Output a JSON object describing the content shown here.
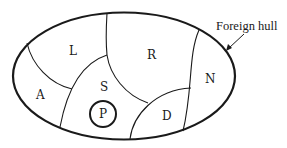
{
  "diagram": {
    "type": "region map inside elliptical hull",
    "hull_label": "Foreign hull",
    "regions": [
      {
        "id": "L",
        "label": "L"
      },
      {
        "id": "R",
        "label": "R"
      },
      {
        "id": "A",
        "label": "A"
      },
      {
        "id": "S",
        "label": "S"
      },
      {
        "id": "N",
        "label": "N"
      },
      {
        "id": "D",
        "label": "D"
      },
      {
        "id": "P",
        "label": "P"
      }
    ],
    "colors": {
      "stroke": "#1a1a1a",
      "background": "#ffffff"
    }
  }
}
